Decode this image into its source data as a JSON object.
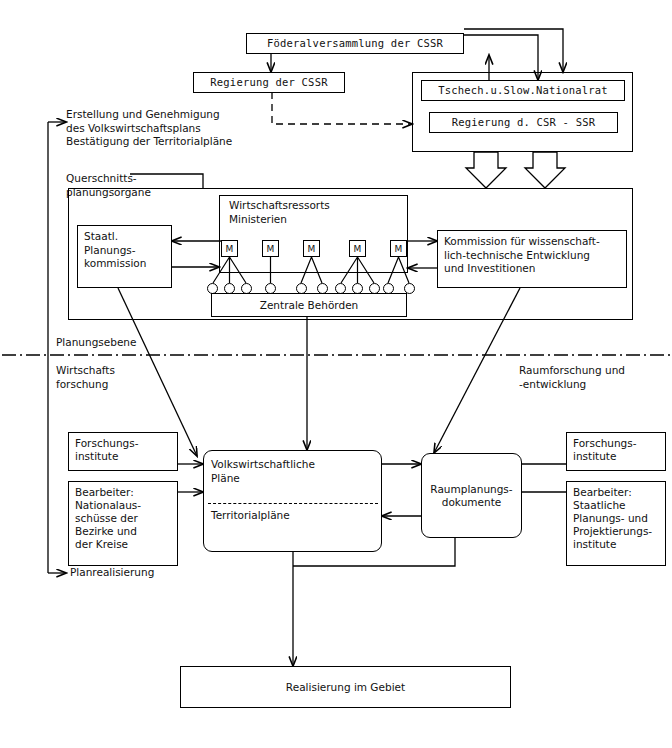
{
  "diagram": {
    "language": "de",
    "top_level": {
      "federal_assembly": {
        "label": "Föderalversammlung der CSSR"
      },
      "federal_government": {
        "label": "Regierung der CSSR"
      },
      "national_council": {
        "label": "Tschech.u.Slow.Nationalrat"
      },
      "republic_governments": {
        "label": "Regierung d. CSR - SSR"
      }
    },
    "left_annotations": {
      "plan_creation": "Erstellung und Genehmigung\ndes Volkswirtschaftsplans\nBestätigung der Territorialpläne",
      "cross_section_organs": "Querschnitts-\nplanungsorgane",
      "plan_realisation": "Planrealisierung"
    },
    "planning_level": {
      "state_planning_commission": "Staatl.\nPlanungs-\nkommission",
      "economic_departments": "Wirtschaftsressorts\nMinisterien",
      "central_authorities": "Zentrale Behörden",
      "science_commission": "Kommission für wissenschaft-\nlich-technische Entwicklung\nund Investitionen",
      "ministry_label": "M",
      "ministries": [
        {
          "label": "M",
          "subordinates": 3
        },
        {
          "label": "M",
          "subordinates": 1
        },
        {
          "label": "M",
          "subordinates": 2
        },
        {
          "label": "M",
          "subordinates": 3
        },
        {
          "label": "M",
          "subordinates": 2
        }
      ]
    },
    "divider": {
      "label": "Planungsebene"
    },
    "research_level": {
      "left_label": "Wirtschafts\nforschung",
      "right_label": "Raumforschung und\n-entwicklung",
      "left_research_institutes": "Forschungs-\ninstitute",
      "left_editors": "Bearbeiter:\nNationalaus-\nschüsse der\nBezirke und\nder Kreise",
      "national_plans_top": "Volkswirtschaftliche\nPläne",
      "national_plans_bottom": "Territorialpläne",
      "spatial_documents": "Raumplanungs-\ndokumente",
      "right_research_institutes": "Forschungs-\ninstitute",
      "right_editors": "Bearbeiter:\nStaatliche\nPlanungs- und\nProjektierungs-\ninstitute"
    },
    "bottom": {
      "realisation": "Realisierung im Gebiet"
    },
    "colors": {
      "line": "#000000",
      "background": "#ffffff",
      "text": "#111111"
    }
  }
}
